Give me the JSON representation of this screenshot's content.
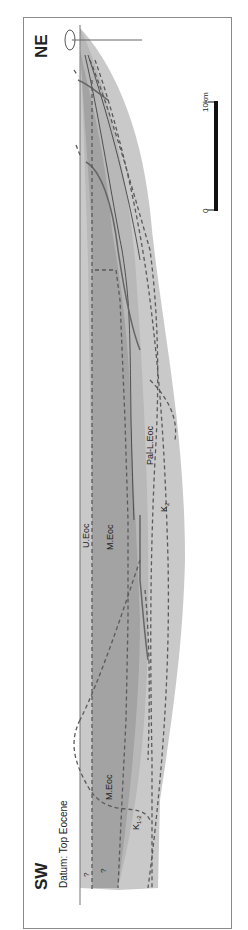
{
  "diagram": {
    "type": "geological-cross-section",
    "orientation": "rotated-90",
    "ends": {
      "left_label": "SW",
      "right_label": "NE"
    },
    "datum": "Datum: Top Eocene",
    "units": [
      {
        "id": "ueoc",
        "label": "U.Eoc"
      },
      {
        "id": "meoc",
        "label": "M.Eoc"
      },
      {
        "id": "meoc_sw",
        "label": "M.Eoc"
      },
      {
        "id": "pal_leoc",
        "label": "Pal-L.Eoc"
      },
      {
        "id": "k2",
        "label": "K",
        "sub": "2"
      },
      {
        "id": "k12",
        "label": "K",
        "sub": "1-2"
      }
    ],
    "uncertain_marks": [
      "?",
      "?"
    ],
    "scale_bar": {
      "start": "0",
      "end": "10km"
    },
    "colors": {
      "light_fill": "#c9c9c9",
      "dark_fill": "#a3a3a3",
      "mid_fill": "#b8b8b8",
      "line": "#555555",
      "dashed": "#5a5a5a"
    }
  }
}
